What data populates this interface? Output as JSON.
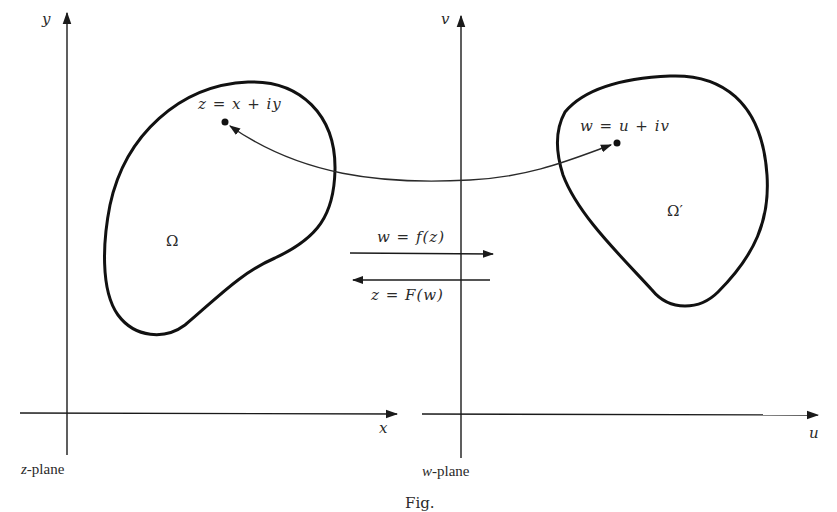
{
  "z_plane": {
    "label": "z-plane",
    "label_var": "z",
    "label_suffix": "-plane",
    "x_axis_label": "x",
    "y_axis_label": "y",
    "region_label": "Ω",
    "point_label": "z = x + iy"
  },
  "w_plane": {
    "label": "w-plane",
    "label_var": "w",
    "label_suffix": "-plane",
    "u_axis_label": "u",
    "v_axis_label": "v",
    "region_label": "Ω′",
    "point_label": "w = u + iv"
  },
  "mappings": {
    "forward": "w = f(z)",
    "inverse": "z = F(w)"
  },
  "caption": "Fig."
}
